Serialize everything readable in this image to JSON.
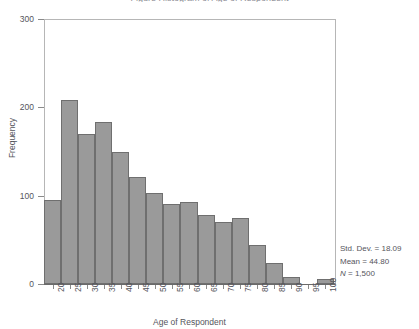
{
  "title": "Figure  Histogram of Age of Respondent",
  "chart_data": {
    "type": "bar",
    "title": "",
    "xlabel": "Age of Respondent",
    "ylabel": "Frequency",
    "categories": [
      "20",
      "25",
      "30",
      "35",
      "40",
      "45",
      "50",
      "55",
      "60",
      "65",
      "70",
      "75",
      "80",
      "85",
      "90",
      "95",
      "100"
    ],
    "values": [
      95,
      208,
      170,
      183,
      150,
      121,
      103,
      91,
      93,
      78,
      70,
      75,
      44,
      24,
      8,
      0,
      6
    ],
    "xlim": [
      20,
      105
    ],
    "ylim": [
      0,
      300
    ],
    "y_ticks": [
      0,
      100,
      200,
      300
    ],
    "x_ticks": [
      "20",
      "25",
      "30",
      "35",
      "40",
      "45",
      "50",
      "55",
      "60",
      "65",
      "70",
      "75",
      "80",
      "85",
      "90",
      "95",
      "100"
    ],
    "grid": false,
    "legend": "none",
    "bar_fill_color": "#9a9a9a",
    "bar_border_color": "#6f6f6f",
    "axis_color": "#8a8a8a",
    "bin_width": 5
  },
  "axes": {
    "y_title": "Frequency",
    "x_title": "Age of Respondent",
    "y_tick_labels": [
      "300",
      "200",
      "100",
      "0"
    ],
    "x_tick_labels": [
      "20",
      "25",
      "30",
      "35",
      "40",
      "45",
      "50",
      "55",
      "60",
      "65",
      "70",
      "75",
      "80",
      "85",
      "90",
      "95",
      "100"
    ]
  },
  "stats": {
    "std_dev": "Std. Dev. = 18.09",
    "mean": "Mean = 44.80",
    "n_symbol": "N",
    "n_value": " = 1,500"
  }
}
